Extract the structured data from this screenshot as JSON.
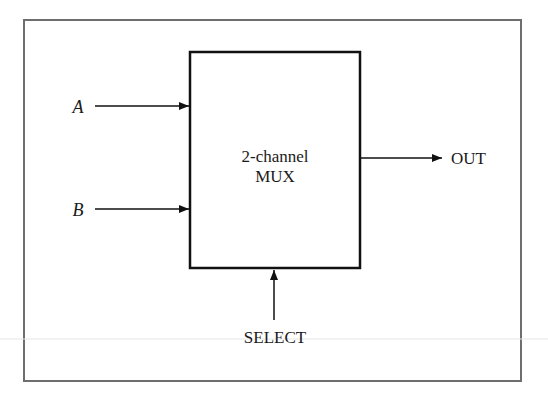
{
  "diagram": {
    "block": {
      "line1": "2-channel",
      "line2": "MUX"
    },
    "inputs": [
      {
        "label": "A"
      },
      {
        "label": "B"
      }
    ],
    "output": {
      "label": "OUT"
    },
    "control": {
      "label": "SELECT"
    },
    "colors": {
      "frame": "#6e6e6e",
      "block": "#111111",
      "text": "#1a1a1a"
    }
  }
}
